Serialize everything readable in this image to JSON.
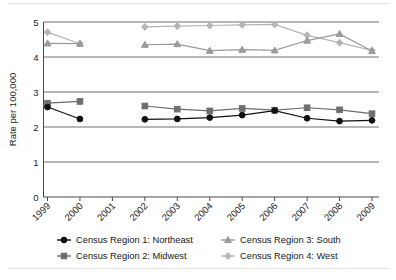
{
  "chart_data": {
    "type": "line",
    "title": "",
    "xlabel": "",
    "ylabel": "Rate per 100,000",
    "x": [
      1999,
      2000,
      2001,
      2002,
      2003,
      2004,
      2005,
      2006,
      2007,
      2008,
      2009
    ],
    "categories": [
      "1999",
      "2000",
      "2001",
      "2002",
      "2003",
      "2004",
      "2005",
      "2006",
      "2007",
      "2008",
      "2009"
    ],
    "ylim": [
      0,
      5
    ],
    "yticks": [
      0,
      1,
      2,
      3,
      4,
      5
    ],
    "ytick_labels": [
      "0",
      "1",
      "2",
      "3",
      "4",
      "5"
    ],
    "grid": true,
    "grid_axis": "y",
    "legend_position": "bottom",
    "series": [
      {
        "name": "Census Region 1: Northeast",
        "key": "northeast",
        "color": "#111111",
        "marker": "circle",
        "values": [
          2.57,
          2.23,
          null,
          2.22,
          2.23,
          2.27,
          2.34,
          2.47,
          2.25,
          2.17,
          2.19
        ]
      },
      {
        "name": "Census Region 2: Midwest",
        "key": "midwest",
        "color": "#6e6e6e",
        "marker": "square",
        "values": [
          2.68,
          2.73,
          null,
          2.6,
          2.51,
          2.46,
          2.53,
          2.48,
          2.55,
          2.49,
          2.38
        ]
      },
      {
        "name": "Census Region 3: South",
        "key": "south",
        "color": "#9a9a9a",
        "marker": "triangle",
        "values": [
          4.39,
          4.38,
          null,
          4.35,
          4.37,
          4.18,
          4.21,
          4.19,
          4.47,
          4.66,
          4.17
        ]
      },
      {
        "name": "Census Region 4: West",
        "key": "west",
        "color": "#b5b5b5",
        "marker": "diamond",
        "values": [
          4.71,
          4.38,
          null,
          4.86,
          4.88,
          4.9,
          4.92,
          4.93,
          4.62,
          4.41,
          4.19
        ]
      }
    ]
  },
  "axis": {
    "y_title": "Rate per 100,000"
  },
  "legend": {
    "items": [
      {
        "label": "Census Region 1: Northeast",
        "key": "northeast"
      },
      {
        "label": "Census Region 2: Midwest",
        "key": "midwest"
      },
      {
        "label": "Census Region 3: South",
        "key": "south"
      },
      {
        "label": "Census Region 4: West",
        "key": "west"
      }
    ]
  }
}
